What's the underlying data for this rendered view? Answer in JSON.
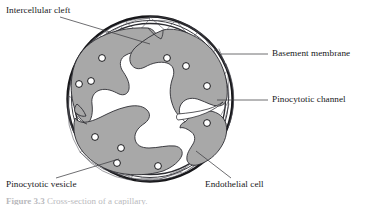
{
  "figure": {
    "caption_prefix": "Figure 3.3",
    "caption_text": "Cross-section of a capillary.",
    "background_color": "#ffffff",
    "outline_color": "#17171a",
    "cell_fill_color": "#a8a8a8",
    "lumen_color": "#ffffff",
    "leader_color": "#3d3d42"
  },
  "labels": {
    "intercellular_cleft": "Intercellular cleft",
    "basement_membrane": "Basement membrane",
    "pinocytotic_channel": "Pinocytotic channel",
    "pinocytotic_vesicle": "Pinocytotic vesicle",
    "endothelial_cell": "Endothelial cell"
  },
  "geometry": {
    "center_x": 150,
    "center_y": 99,
    "outer_radius": 82,
    "inner_radius": 75
  },
  "vesicles": [
    {
      "cx": 102,
      "cy": 58,
      "r": 3.4
    },
    {
      "cx": 79,
      "cy": 84,
      "r": 3.4
    },
    {
      "cx": 91,
      "cy": 81,
      "r": 3.4
    },
    {
      "cx": 167,
      "cy": 58,
      "r": 3.4
    },
    {
      "cx": 186,
      "cy": 66,
      "r": 3.4
    },
    {
      "cx": 207,
      "cy": 86,
      "r": 3.4
    },
    {
      "cx": 207,
      "cy": 123,
      "r": 3.4
    },
    {
      "cx": 95,
      "cy": 137,
      "r": 3.4
    },
    {
      "cx": 121,
      "cy": 148,
      "r": 3.4
    },
    {
      "cx": 117,
      "cy": 163,
      "r": 3.4
    },
    {
      "cx": 158,
      "cy": 166,
      "r": 3.4
    }
  ],
  "leader_lines": [
    {
      "name": "intercellular-cleft-leader",
      "x1": 60,
      "y1": 17,
      "x2": 148,
      "y2": 44
    },
    {
      "name": "basement-membrane-leader",
      "x1": 268,
      "y1": 54,
      "x2": 222,
      "y2": 54
    },
    {
      "name": "pinocytotic-channel-leader",
      "x1": 268,
      "y1": 100,
      "x2": 218,
      "y2": 100
    },
    {
      "name": "pinocytotic-vesicle-leader",
      "x1": 56,
      "y1": 178,
      "x2": 118,
      "y2": 160
    },
    {
      "name": "endothelial-cell-leader",
      "x1": 231,
      "y1": 178,
      "x2": 196,
      "y2": 152
    }
  ]
}
